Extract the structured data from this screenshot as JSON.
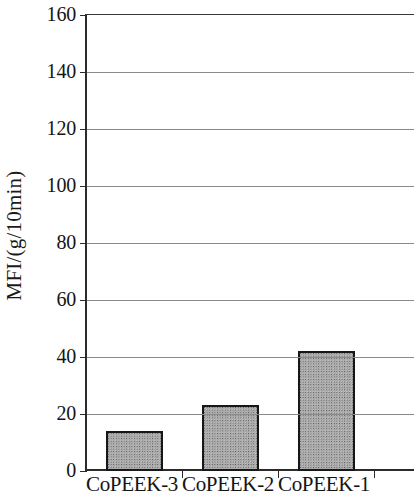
{
  "chart_data": {
    "type": "bar",
    "title": "",
    "subtitle": "",
    "xlabel": "",
    "ylabel": "MFI/(g/10min)",
    "categories": [
      "CoPEEK-3",
      "CoPEEK-2",
      "CoPEEK-1"
    ],
    "values": [
      14,
      23,
      42
    ],
    "series": [
      {
        "name": "MFI",
        "values": [
          14,
          23,
          42
        ]
      }
    ],
    "ylim": [
      0,
      160
    ],
    "ytick_values": [
      0,
      20,
      40,
      60,
      80,
      100,
      120,
      140,
      160
    ],
    "ytick_labels": [
      "0",
      "20",
      "40",
      "60",
      "80",
      "100",
      "120",
      "140",
      "160"
    ],
    "grid": "horizontal",
    "legend": "none",
    "annotations": [],
    "style": {
      "bar_fill_color": "#ababab",
      "bar_fill_pattern": "stipple-dots",
      "bar_edge_color": "#171717",
      "gridline_color": "#8a8a8a",
      "axis_color": "#2b2b2b",
      "text_color": "#141414",
      "background_color": "#ffffff"
    }
  }
}
